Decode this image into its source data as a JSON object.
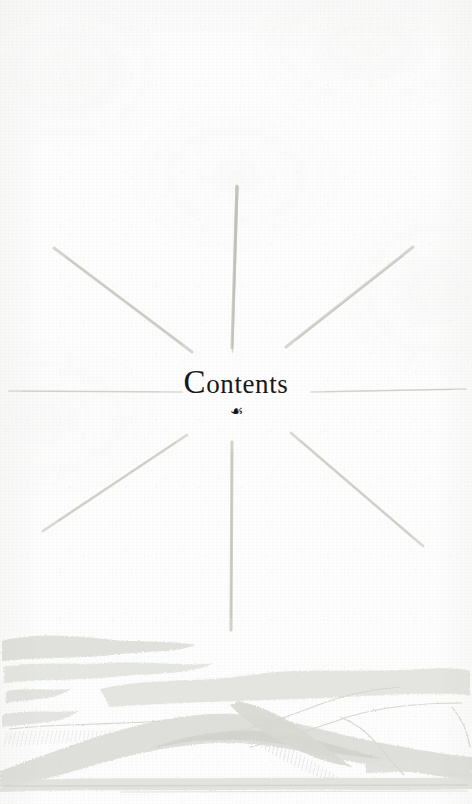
{
  "page": {
    "kind": "book-contents-divider-page",
    "width": 472,
    "height": 804,
    "background_color": "#fdfdfc",
    "paper_tone": "#fdfdfd"
  },
  "heading": {
    "title": "Contents",
    "title_initial": "C",
    "title_rest": "ontents",
    "ornament": "☙",
    "ornament_name": "aldus-leaf-fleuron",
    "ink_color": "#18161a",
    "font_style": "serif",
    "center_x": 237,
    "baseline_y": 392
  },
  "sunburst": {
    "name": "eight-ray-sunburst",
    "center_x": 232,
    "center_y": 392,
    "ray_color": "#c9c7c0",
    "ray_count": 8,
    "rays": [
      {
        "name": "ray-up",
        "x1": 232,
        "y1": 345,
        "x2": 237,
        "y2": 185,
        "width": 3.2
      },
      {
        "name": "ray-down",
        "x1": 232,
        "y1": 440,
        "x2": 231,
        "y2": 632,
        "width": 3.2
      },
      {
        "name": "ray-left",
        "x1": 180,
        "y1": 392,
        "x2": 8,
        "y2": 391,
        "width": 1.6
      },
      {
        "name": "ray-right",
        "x1": 312,
        "y1": 392,
        "x2": 466,
        "y2": 389,
        "width": 1.6
      },
      {
        "name": "ray-upper-left",
        "x1": 190,
        "y1": 350,
        "x2": 53,
        "y2": 247,
        "width": 2.8
      },
      {
        "name": "ray-upper-right",
        "x1": 288,
        "y1": 345,
        "x2": 412,
        "y2": 247,
        "width": 2.8
      },
      {
        "name": "ray-lower-left",
        "x1": 185,
        "y1": 434,
        "x2": 42,
        "y2": 530,
        "width": 2.8
      },
      {
        "name": "ray-lower-right",
        "x1": 292,
        "y1": 432,
        "x2": 422,
        "y2": 545,
        "width": 2.8
      }
    ]
  },
  "landscape": {
    "name": "bottom-landscape-illustration",
    "description": "faint engraved hills, clouds and shoreline",
    "ink_color": "#dedfda",
    "shoreline_y": 786,
    "top_y": 648
  },
  "colors": {
    "paper": "#fdfdfc",
    "ink": "#18161a",
    "ray": "#c9c7c0",
    "illustration": "#dedfda"
  }
}
